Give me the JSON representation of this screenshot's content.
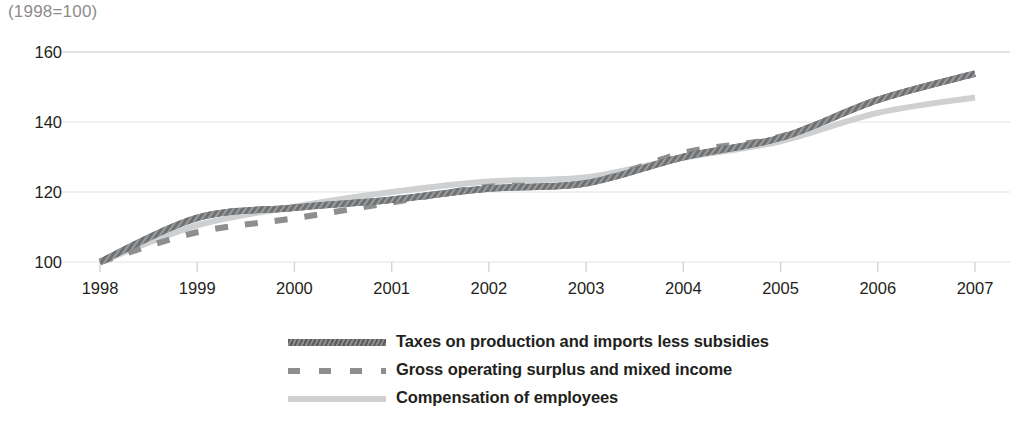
{
  "index_note": "(1998=100)",
  "legend": {
    "items": [
      {
        "label": "Taxes on production and imports less subsidies",
        "style": "solid-dark",
        "color": "#6f7072"
      },
      {
        "label": "Gross operating surplus and mixed income",
        "style": "dashed",
        "color": "#8d8e90"
      },
      {
        "label": "Compensation of employees",
        "style": "solid-light",
        "color": "#cfd0d1"
      }
    ]
  },
  "chart_data": {
    "type": "line",
    "title": "",
    "subtitle": "",
    "xlabel": "",
    "ylabel": "",
    "index_note": "(1998=100)",
    "categories": [
      "1998",
      "1999",
      "2000",
      "2001",
      "2002",
      "2003",
      "2004",
      "2005",
      "2006",
      "2007"
    ],
    "x": [
      1998,
      1999,
      2000,
      2001,
      2002,
      2003,
      2004,
      2005,
      2006,
      2007
    ],
    "xlim": [
      1998,
      2007
    ],
    "ylim": [
      100,
      160
    ],
    "y_ticks": [
      100,
      120,
      140,
      160
    ],
    "x_ticks": [
      "1998",
      "1999",
      "2000",
      "2001",
      "2002",
      "2003",
      "2004",
      "2005",
      "2006",
      "2007"
    ],
    "grid": true,
    "grid_axis": "y",
    "legend_position": "bottom-center",
    "series": [
      {
        "name": "Taxes on production and imports less subsidies",
        "color": "#6f7072",
        "style": "solid",
        "values": [
          100.0,
          112.6,
          115.5,
          117.8,
          121.0,
          122.5,
          130.0,
          135.5,
          146.3,
          153.8
        ]
      },
      {
        "name": "Gross operating surplus and mixed income",
        "color": "#8d8e90",
        "style": "dashed",
        "values": [
          100.0,
          108.5,
          112.5,
          117.0,
          121.5,
          122.5,
          131.2,
          135.8,
          146.3,
          153.8
        ]
      },
      {
        "name": "Compensation of employees",
        "color": "#cfd0d1",
        "style": "solid",
        "values": [
          100.0,
          110.5,
          115.8,
          120.0,
          123.0,
          124.2,
          129.8,
          134.5,
          142.6,
          147.0
        ]
      }
    ]
  }
}
